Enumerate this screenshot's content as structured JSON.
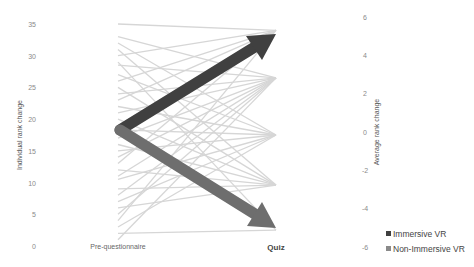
{
  "chart_data": {
    "type": "line",
    "title": "",
    "categories": [
      "Pre-questionnaire",
      "Quiz"
    ],
    "left_axis": {
      "label": "Individual rank change",
      "ticks": [
        0,
        5,
        10,
        15,
        20,
        25,
        30,
        35
      ],
      "range": [
        0,
        35
      ]
    },
    "right_axis": {
      "label": "Average rank change",
      "ticks": [
        -6,
        -4,
        -2,
        0,
        2,
        4,
        6
      ],
      "range": [
        -6,
        6
      ]
    },
    "individual_lines_color": "#d4d4d4",
    "individual_lines": [
      [
        35,
        34
      ],
      [
        33,
        26.5
      ],
      [
        32,
        17.5
      ],
      [
        31,
        9.6
      ],
      [
        30,
        34
      ],
      [
        29,
        2.5
      ],
      [
        28.5,
        26.5
      ],
      [
        27,
        17.5
      ],
      [
        26,
        34
      ],
      [
        25,
        9.6
      ],
      [
        24,
        26.5
      ],
      [
        23,
        34
      ],
      [
        22,
        17.5
      ],
      [
        21,
        26.5
      ],
      [
        20,
        9.6
      ],
      [
        19,
        34
      ],
      [
        18.3,
        17.5
      ],
      [
        17,
        26.5
      ],
      [
        16,
        9.6
      ],
      [
        15,
        17.5
      ],
      [
        14,
        26.5
      ],
      [
        13,
        34
      ],
      [
        12,
        9.6
      ],
      [
        11,
        26.5
      ],
      [
        10.5,
        17.5
      ],
      [
        9,
        9.6
      ],
      [
        8,
        26.5
      ],
      [
        7,
        17.5
      ],
      [
        6,
        9.6
      ],
      [
        5,
        26.5
      ],
      [
        4,
        34
      ],
      [
        3,
        17.5
      ],
      [
        2,
        2.5
      ],
      [
        1,
        26.5
      ]
    ],
    "series": [
      {
        "name": "Immersive VR",
        "axis": "right",
        "values": [
          0,
          5
        ],
        "color": "#404040"
      },
      {
        "name": "Non-Immersive VR",
        "axis": "right",
        "values": [
          0,
          -5
        ],
        "color": "#6e6e6e"
      }
    ],
    "legend": {
      "position": "bottom-right",
      "entries": [
        "Immersive VR",
        "Non-Immersive VR"
      ]
    },
    "grid": false
  },
  "axes": {
    "left_title": "Individual rank change",
    "right_title": "Average rank change",
    "left_ticks": [
      "35",
      "30",
      "25",
      "20",
      "15",
      "10",
      "5",
      "0"
    ],
    "right_ticks": [
      "6",
      "4",
      "2",
      "0",
      "-2",
      "-4",
      "-6"
    ]
  },
  "categories": {
    "pre": "Pre-questionnaire",
    "quiz": "Quiz"
  },
  "legend": {
    "immersive": "Immersive VR",
    "non_immersive": "Non-Immersive VR",
    "immersive_color": "#404040",
    "non_immersive_color": "#7a7a7a"
  }
}
